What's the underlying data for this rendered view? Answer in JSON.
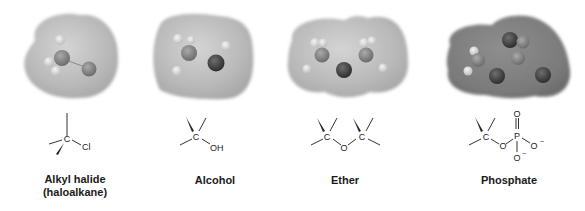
{
  "figure": {
    "panels": [
      {
        "id": "alkyl-halide",
        "label_line1": "Alkyl halide",
        "label_line2": "(haloalkane)",
        "structure": {
          "center_atom": "C",
          "substituent": "Cl"
        }
      },
      {
        "id": "alcohol",
        "label_line1": "Alcohol",
        "structure": {
          "center_atom": "C",
          "substituent": "OH"
        }
      },
      {
        "id": "ether",
        "label_line1": "Ether",
        "structure": {
          "atom_left": "C",
          "bridge": "O",
          "atom_right": "C"
        }
      },
      {
        "id": "phosphate",
        "label_line1": "Phosphate",
        "structure": {
          "center_atom": "C",
          "bridge": "O",
          "phosphorus": "P",
          "double_o": "O",
          "o_right": "O",
          "o_bottom": "O",
          "charge": "−"
        }
      }
    ],
    "colors": {
      "surface_light": "#c4c4c4",
      "surface_dark": "#8a8a8a",
      "atom_dark": "#3a3a3a",
      "atom_light": "#e6e6e6",
      "bond": "#333333",
      "text": "#1a1a1a"
    }
  }
}
